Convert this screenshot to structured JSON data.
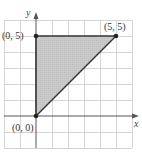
{
  "figure": {
    "type": "region-diagram",
    "axes": {
      "x_label": "x",
      "y_label": "y",
      "grid": true,
      "grid_spacing_units": 1,
      "x_range": [
        -2,
        6
      ],
      "y_range": [
        -2,
        6
      ]
    },
    "points": [
      {
        "label": "(0, 0)",
        "x": 0,
        "y": 0
      },
      {
        "label": "(0, 5)",
        "x": 0,
        "y": 5
      },
      {
        "label": "(5, 5)",
        "x": 5,
        "y": 5
      }
    ],
    "region": {
      "shape": "triangle",
      "vertices": [
        [
          0,
          0
        ],
        [
          0,
          5
        ],
        [
          5,
          5
        ]
      ],
      "fill_color": "#c8c8c8",
      "edge_color": "#333333"
    },
    "colors": {
      "grid": "#d6d6d6",
      "axis": "#555555",
      "point": "#222222"
    }
  }
}
